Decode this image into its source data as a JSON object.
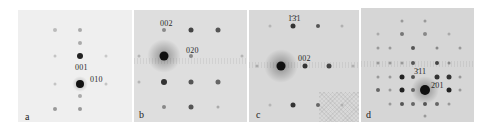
{
  "figure": {
    "panels": [
      {
        "id": "a",
        "label": "a",
        "background": "#efefef",
        "x": 18,
        "width": 114,
        "index_labels": [
          {
            "text": "001",
            "x": 57,
            "y": 54
          },
          {
            "text": "010",
            "x": 72,
            "y": 66
          }
        ],
        "transmitted_beam": {
          "x": 62,
          "y": 74
        }
      },
      {
        "id": "b",
        "label": "b",
        "background": "#dedede",
        "x": 134,
        "width": 113,
        "index_labels": [
          {
            "text": "002",
            "x": 27,
            "y": 10
          },
          {
            "text": "020",
            "x": 67,
            "y": 38
          }
        ],
        "transmitted_beam": {
          "x": 30,
          "y": 46
        }
      },
      {
        "id": "c",
        "label": "c",
        "background": "#d8d8d8",
        "x": 249,
        "width": 110,
        "index_labels": [
          {
            "text": "1̄3̄1",
            "x": 39,
            "y": 6
          },
          {
            "text": "002",
            "x": 51,
            "y": 45
          }
        ],
        "transmitted_beam": {
          "x": 32,
          "y": 56
        }
      },
      {
        "id": "d",
        "label": "d",
        "background": "#d6d6d6",
        "x": 361,
        "width": 113,
        "index_labels": [
          {
            "text": "3̄11",
            "x": 53,
            "y": 60
          },
          {
            "text": "2̄01",
            "x": 70,
            "y": 74
          }
        ],
        "transmitted_beam": {
          "x": 64,
          "y": 80
        }
      }
    ]
  }
}
